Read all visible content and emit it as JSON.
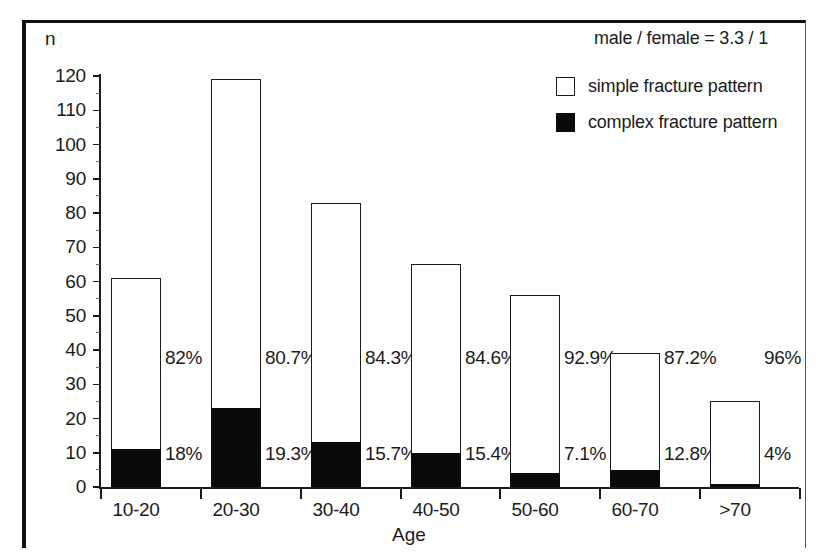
{
  "figure": {
    "y_axis_title": "n",
    "x_axis_title": "Age",
    "ratio_note": "male / female = 3.3 / 1"
  },
  "legend": {
    "simple_label": "simple fracture pattern",
    "complex_label": "complex fracture pattern",
    "simple_color": "#ffffff",
    "complex_color": "#0a0a0a"
  },
  "chart_data": {
    "type": "bar",
    "subtype": "stacked-bar",
    "title": "",
    "subtitle": "",
    "xlabel": "Age",
    "ylabel": "n",
    "ylim": [
      0,
      120
    ],
    "yticks": [
      0,
      10,
      20,
      30,
      40,
      50,
      60,
      70,
      80,
      90,
      100,
      110,
      120
    ],
    "ytick_labels": [
      "0",
      "10",
      "20",
      "30",
      "40",
      "50",
      "60",
      "70",
      "80",
      "90",
      "100",
      "110",
      "120"
    ],
    "grid": false,
    "legend_position": "top-right",
    "categories": [
      "10-20",
      "20-30",
      "30-40",
      "40-50",
      "50-60",
      "60-70",
      ">70"
    ],
    "totals": [
      61,
      119,
      83,
      65,
      56,
      39,
      25
    ],
    "series": [
      {
        "name": "complex fracture pattern",
        "color": "#0a0a0a",
        "values": [
          11,
          23,
          13,
          10,
          4,
          5,
          1
        ],
        "percent_labels": [
          "18%",
          "19.3%",
          "15.7%",
          "15.4%",
          "7.1%",
          "12.8%",
          "4%"
        ]
      },
      {
        "name": "simple fracture pattern",
        "color": "#ffffff",
        "values": [
          50,
          96,
          70,
          55,
          52,
          34,
          24
        ],
        "percent_labels": [
          "82%",
          "80.7%",
          "84.3%",
          "84.6%",
          "92.9%",
          "87.2%",
          "96%"
        ]
      }
    ],
    "annotations": [
      "male / female = 3.3 / 1"
    ]
  }
}
